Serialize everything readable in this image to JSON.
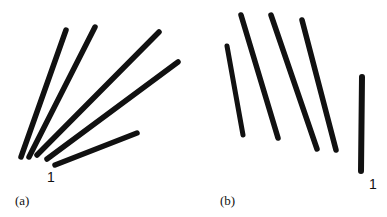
{
  "figure": {
    "panels": [
      {
        "id": "a",
        "caption": "(a)",
        "marker_label": "1",
        "description": "Five line segments converging at lower-left in a fan pattern",
        "lines": [
          {
            "x1": 66,
            "y1": 30,
            "x2": 21,
            "y2": 157,
            "width": 5.5
          },
          {
            "x1": 95,
            "y1": 27,
            "x2": 29,
            "y2": 157,
            "width": 5.5
          },
          {
            "x1": 159,
            "y1": 32,
            "x2": 37,
            "y2": 155,
            "width": 5.5
          },
          {
            "x1": 178,
            "y1": 62,
            "x2": 47,
            "y2": 159,
            "width": 5.5
          },
          {
            "x1": 137,
            "y1": 133,
            "x2": 55,
            "y2": 165,
            "width": 5.5
          }
        ],
        "marker_pos": {
          "x": 47,
          "y": 182
        },
        "caption_pos": {
          "x": 15,
          "y": 205
        }
      },
      {
        "id": "b",
        "caption": "(b)",
        "marker_label": "1",
        "description": "Four parallel slanted line segments and one vertical segment",
        "lines": [
          {
            "x1": 227,
            "y1": 46,
            "x2": 243,
            "y2": 135,
            "width": 5
          },
          {
            "x1": 241,
            "y1": 15,
            "x2": 278,
            "y2": 138,
            "width": 5.5
          },
          {
            "x1": 271,
            "y1": 15,
            "x2": 317,
            "y2": 149,
            "width": 5.5
          },
          {
            "x1": 302,
            "y1": 20,
            "x2": 336,
            "y2": 150,
            "width": 5.5
          },
          {
            "x1": 362,
            "y1": 77,
            "x2": 361,
            "y2": 171,
            "width": 6
          }
        ],
        "marker_pos": {
          "x": 369,
          "y": 189
        },
        "caption_pos": {
          "x": 220,
          "y": 205
        }
      }
    ]
  }
}
